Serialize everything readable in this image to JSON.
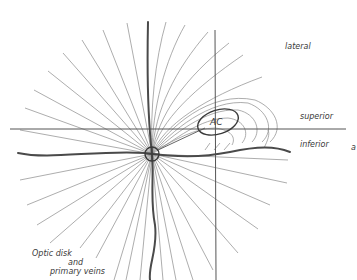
{
  "diagram": {
    "labels": {
      "lateral": "lateral",
      "superior": "superior",
      "inferior": "inferior",
      "ac": "AC",
      "optic_disk_line1": "Optic disk",
      "optic_disk_line2": "and",
      "optic_disk_line3": "primary veins",
      "edge_fragment": "a"
    },
    "colors": {
      "background": "#ffffff",
      "fine_lines": "#8a8a8a",
      "axis": "#555555",
      "veins": "#4a4a4a",
      "text": "#3a3a3a"
    },
    "geometry": {
      "optic_disk_center": [
        152,
        154
      ],
      "optic_disk_radius": 7,
      "ac_center": [
        218,
        122
      ],
      "horizontal_axis_y": 129,
      "vertical_axis_x": 215
    }
  }
}
